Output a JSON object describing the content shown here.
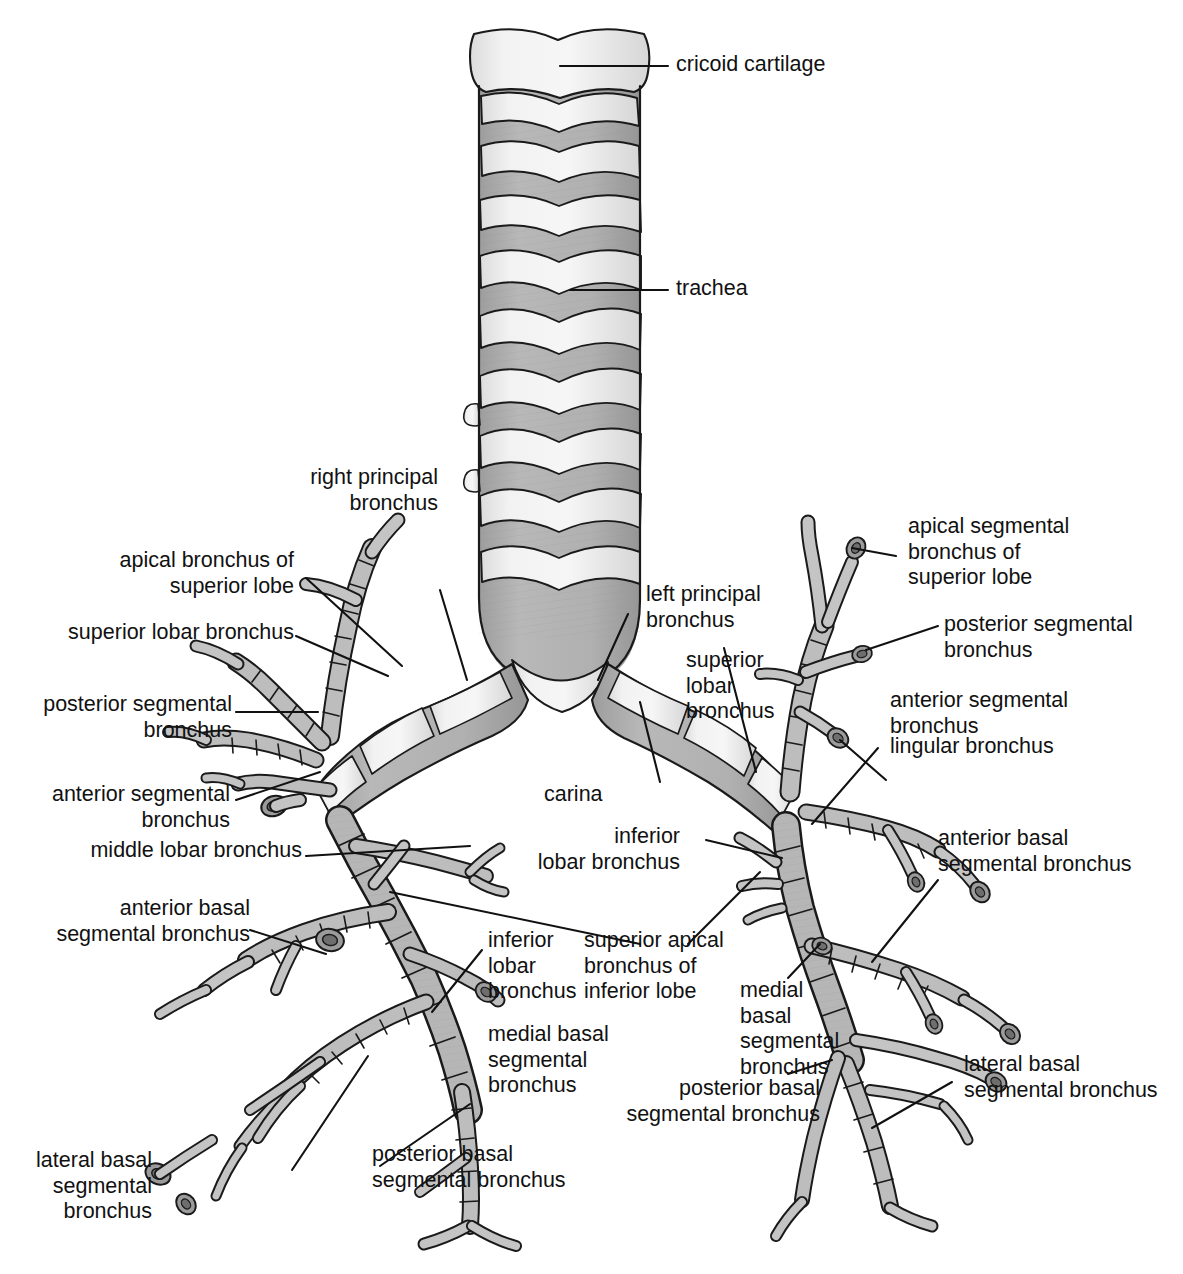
{
  "figure": {
    "type": "anatomical-diagram",
    "colors": {
      "cartilage_light": "#ececec",
      "cartilage_mid": "#d2d2d2",
      "muscle_dark": "#a8a8a8",
      "outline": "#1a1a1a",
      "background": "#ffffff",
      "text": "#111111"
    }
  },
  "labels": {
    "cricoid_cartilage": "cricoid cartilage",
    "trachea": "trachea",
    "right_principal_bronchus": "right principal\nbronchus",
    "apical_bronchus_superior_lobe": "apical bronchus of\nsuperior lobe",
    "superior_lobar_bronchus_right": "superior lobar bronchus",
    "posterior_segmental_bronchus_right": "posterior segmental\nbronchus",
    "anterior_segmental_bronchus_right": "anterior segmental\nbronchus",
    "middle_lobar_bronchus": "middle lobar bronchus",
    "anterior_basal_segmental_bronchus_right": "anterior basal\nsegmental bronchus",
    "lateral_basal_segmental_bronchus_right": "lateral basal\nsegmental\nbronchus",
    "posterior_basal_segmental_bronchus_right": "posterior basal\nsegmental bronchus",
    "inferior_lobar_bronchus_right": "inferior\nlobar\nbronchus",
    "medial_basal_segmental_bronchus_right": "medial basal\nsegmental\nbronchus",
    "carina": "carina",
    "left_principal_bronchus": "left principal\nbronchus",
    "superior_lobar_bronchus_left": "superior\nlobar\nbronchus",
    "inferior_lobar_bronchus_left": "inferior\nlobar bronchus",
    "superior_apical_bronchus_inferior_lobe": "superior apical\nbronchus of\ninferior lobe",
    "apical_segmental_bronchus_superior_lobe": "apical segmental\nbronchus of\nsuperior lobe",
    "posterior_segmental_bronchus_left": "posterior segmental\nbronchus",
    "anterior_segmental_bronchus_left": "anterior segmental\nbronchus",
    "lingular_bronchus": "lingular bronchus",
    "anterior_basal_segmental_bronchus_left": "anterior basal\nsegmental bronchus",
    "medial_basal_segmental_bronchus_left": "medial\nbasal\nsegmental\nbronchus",
    "posterior_basal_segmental_bronchus_left": "posterior basal\nsegmental bronchus",
    "lateral_basal_segmental_bronchus_left": "lateral basal\nsegmental bronchus"
  }
}
